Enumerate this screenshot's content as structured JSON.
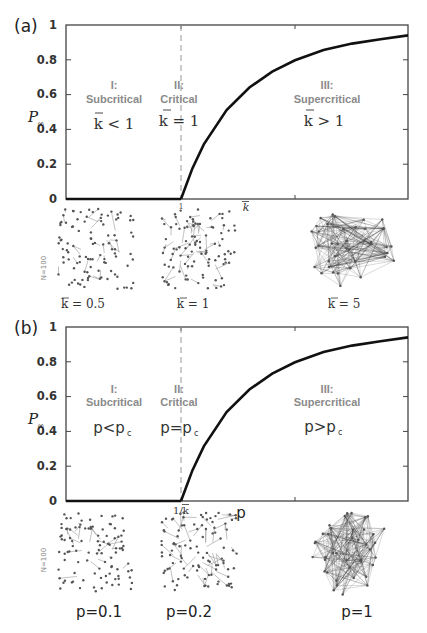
{
  "chart_data": [
    {
      "panel": "(a)",
      "type": "line",
      "title": "",
      "xlabel": "k̄",
      "ylabel": "P∞",
      "xlim": [
        0,
        3
      ],
      "ylim": [
        0,
        1
      ],
      "x_ticks": [
        {
          "value": 1,
          "label": "1"
        },
        {
          "value": 2,
          "label": ""
        }
      ],
      "y_ticks": [
        "0",
        "0.2",
        "0.4",
        "0.6",
        "0.8",
        "1"
      ],
      "grid": false,
      "critical_line": {
        "x": 1,
        "style": "dashed"
      },
      "series": [
        {
          "name": "P∞",
          "x": [
            0,
            0.5,
            1.0,
            1.1,
            1.2,
            1.4,
            1.6,
            1.8,
            2.0,
            2.25,
            2.5,
            2.75,
            3.0
          ],
          "values": [
            0,
            0,
            0,
            0.176,
            0.314,
            0.511,
            0.641,
            0.732,
            0.797,
            0.856,
            0.893,
            0.918,
            0.94
          ]
        }
      ],
      "regions": [
        {
          "id": "I",
          "title": "I:",
          "name": "Subcritical",
          "condition": "k̄ < 1"
        },
        {
          "id": "II",
          "title": "II:",
          "name": "Critical",
          "condition": "k̄ = 1"
        },
        {
          "id": "III",
          "title": "III:",
          "name": "Supercritical",
          "condition": "k̄ > 1"
        }
      ],
      "network_samples": [
        {
          "label": "k̄ = 0.5",
          "density": "sparse"
        },
        {
          "label": "k̄ = 1",
          "density": "medium"
        },
        {
          "label": "k̄ = 5",
          "density": "dense"
        }
      ],
      "network_size_label": "N=100"
    },
    {
      "panel": "(b)",
      "type": "line",
      "title": "",
      "xlabel": "p",
      "ylabel": "P∞",
      "xlim": [
        0,
        3
      ],
      "ylim": [
        0,
        1
      ],
      "x_ticks": [
        {
          "value": 1,
          "label": "1/k̄"
        },
        {
          "value": 2,
          "label": ""
        }
      ],
      "y_ticks": [
        "0",
        "0.2",
        "0.4",
        "0.6",
        "0.8",
        "1"
      ],
      "grid": false,
      "critical_line": {
        "x": 1,
        "style": "dashed"
      },
      "series": [
        {
          "name": "P∞",
          "x": [
            0,
            0.5,
            1.0,
            1.1,
            1.2,
            1.4,
            1.6,
            1.8,
            2.0,
            2.25,
            2.5,
            2.75,
            3.0
          ],
          "values": [
            0,
            0,
            0,
            0.176,
            0.314,
            0.511,
            0.641,
            0.732,
            0.797,
            0.856,
            0.893,
            0.918,
            0.94
          ]
        }
      ],
      "regions": [
        {
          "id": "I",
          "title": "I:",
          "name": "Subcritical",
          "condition": "p<pc"
        },
        {
          "id": "II",
          "title": "II:",
          "name": "Critical",
          "condition": "p=pc"
        },
        {
          "id": "III",
          "title": "III:",
          "name": "Supercritical",
          "condition": "p>pc"
        }
      ],
      "network_samples": [
        {
          "label": "p=0.1",
          "density": "sparse"
        },
        {
          "label": "p=0.2",
          "density": "medium"
        },
        {
          "label": "p=1",
          "density": "dense"
        }
      ],
      "network_size_label": "N=100"
    }
  ],
  "panels": {
    "a": {
      "label": "(a)",
      "ylabel": "P",
      "ylabel_sub": "∞",
      "xlabel": "k",
      "x_tick_1": "1",
      "y_ticks": [
        "0",
        "0.2",
        "0.4",
        "0.6",
        "0.8",
        "1"
      ],
      "region1_title": "I:",
      "region1_name": "Subcritical",
      "region1_cond": "k < 1",
      "region2_title": "II:",
      "region2_name": "Critical",
      "region2_cond": "k = 1",
      "region3_title": "III:",
      "region3_name": "Supercritical",
      "region3_cond": "k > 1",
      "net1_label": "k = 0.5",
      "net2_label": "k = 1",
      "net3_label": "k = 5",
      "n_label": "N=100"
    },
    "b": {
      "label": "(b)",
      "ylabel": "P",
      "ylabel_sub": "∞",
      "xlabel": "p",
      "x_tick_1": "1/k",
      "y_ticks": [
        "0",
        "0.2",
        "0.4",
        "0.6",
        "0.8",
        "1"
      ],
      "region1_title": "I:",
      "region1_name": "Subcritical",
      "region1_cond_main": "p<p",
      "region1_cond_sub": "c",
      "region2_title": "II:",
      "region2_name": "Critical",
      "region2_cond_main": "p=p",
      "region2_cond_sub": "c",
      "region3_title": "III:",
      "region3_name": "Supercritical",
      "region3_cond_main": "p>p",
      "region3_cond_sub": "c",
      "net1_label": "p=0.1",
      "net2_label": "p=0.2",
      "net3_label": "p=1",
      "n_label": "N=100"
    }
  }
}
